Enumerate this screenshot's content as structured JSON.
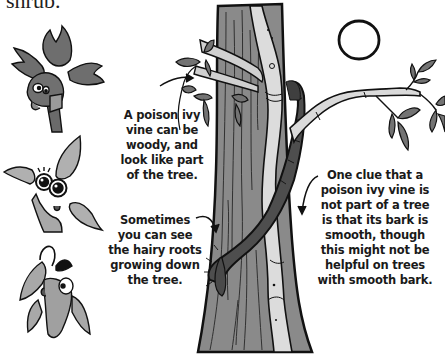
{
  "header": {
    "partial_text": "shrub."
  },
  "captions": {
    "woody_vine": [
      "A poison ivy",
      "vine can be",
      "woody, and",
      "look like part",
      "of the tree."
    ],
    "hairy_roots": [
      "Sometimes",
      "you can see",
      "the hairy roots",
      "growing down",
      "the tree."
    ],
    "bark_clue": [
      "One clue that a",
      "poison ivy vine is",
      "not part of a tree",
      "is that its bark is",
      "smooth, though",
      "this might not be",
      "helpful on trees",
      "with smooth bark."
    ]
  },
  "illustration": {
    "characters": [
      "leaf-character-three-leaflets-top",
      "leaf-character-big-eyes-middle",
      "leaf-character-drooping-bottom"
    ],
    "scene": "tree-trunk-with-poison-ivy-vine",
    "sun": "circle-outline"
  },
  "colors": {
    "leaf_dark": "#6e6e6e",
    "leaf_light": "#a8a8a8",
    "bark": "#8a8a8a",
    "bark_dark": "#5a5a5a",
    "vine_light": "#d8d8d8",
    "ink": "#111111",
    "background": "#ffffff"
  }
}
